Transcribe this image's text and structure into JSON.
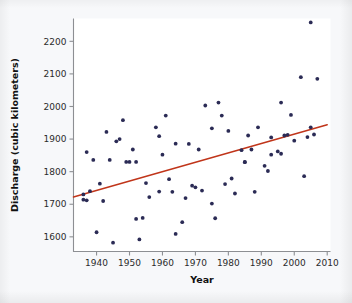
{
  "chart_data": {
    "type": "scatter",
    "title": "",
    "xlabel": "Year",
    "ylabel": "Discharge (cubic kilometers)",
    "xlim": [
      1933,
      2011
    ],
    "ylim": [
      1555,
      2270
    ],
    "grid": false,
    "legend": null,
    "x_ticks": [
      1940,
      1950,
      1960,
      1970,
      1980,
      1990,
      2000,
      2010
    ],
    "y_ticks": [
      1600,
      1700,
      1800,
      1900,
      2000,
      2100,
      2200
    ],
    "point_color": "#2b2b55",
    "trend_color": "#c0351a",
    "trend_line": {
      "name": "linear trend",
      "x_start": 1933,
      "y_start": 1722,
      "x_end": 2010,
      "y_end": 1944
    },
    "points": [
      {
        "x": 1936,
        "y": 1730
      },
      {
        "x": 1936,
        "y": 1714
      },
      {
        "x": 1937,
        "y": 1712
      },
      {
        "x": 1937,
        "y": 1860
      },
      {
        "x": 1938,
        "y": 1740
      },
      {
        "x": 1939,
        "y": 1836
      },
      {
        "x": 1940,
        "y": 1614
      },
      {
        "x": 1941,
        "y": 1763
      },
      {
        "x": 1942,
        "y": 1710
      },
      {
        "x": 1943,
        "y": 1922
      },
      {
        "x": 1944,
        "y": 1836
      },
      {
        "x": 1945,
        "y": 1582
      },
      {
        "x": 1946,
        "y": 1893
      },
      {
        "x": 1947,
        "y": 1900
      },
      {
        "x": 1948,
        "y": 1958
      },
      {
        "x": 1949,
        "y": 1830
      },
      {
        "x": 1950,
        "y": 1830
      },
      {
        "x": 1951,
        "y": 1868
      },
      {
        "x": 1952,
        "y": 1830
      },
      {
        "x": 1952,
        "y": 1655
      },
      {
        "x": 1953,
        "y": 1592
      },
      {
        "x": 1954,
        "y": 1658
      },
      {
        "x": 1955,
        "y": 1765
      },
      {
        "x": 1956,
        "y": 1722
      },
      {
        "x": 1958,
        "y": 1936
      },
      {
        "x": 1959,
        "y": 1909
      },
      {
        "x": 1959,
        "y": 1739
      },
      {
        "x": 1960,
        "y": 1852
      },
      {
        "x": 1961,
        "y": 1972
      },
      {
        "x": 1962,
        "y": 1777
      },
      {
        "x": 1963,
        "y": 1738
      },
      {
        "x": 1964,
        "y": 1886
      },
      {
        "x": 1964,
        "y": 1609
      },
      {
        "x": 1966,
        "y": 1645
      },
      {
        "x": 1967,
        "y": 1719
      },
      {
        "x": 1968,
        "y": 1885
      },
      {
        "x": 1969,
        "y": 1757
      },
      {
        "x": 1970,
        "y": 1752
      },
      {
        "x": 1971,
        "y": 1868
      },
      {
        "x": 1972,
        "y": 1742
      },
      {
        "x": 1973,
        "y": 2003
      },
      {
        "x": 1975,
        "y": 1933
      },
      {
        "x": 1975,
        "y": 1702
      },
      {
        "x": 1976,
        "y": 1657
      },
      {
        "x": 1977,
        "y": 2012
      },
      {
        "x": 1978,
        "y": 1972
      },
      {
        "x": 1979,
        "y": 1762
      },
      {
        "x": 1980,
        "y": 1925
      },
      {
        "x": 1981,
        "y": 1779
      },
      {
        "x": 1982,
        "y": 1733
      },
      {
        "x": 1984,
        "y": 1866
      },
      {
        "x": 1985,
        "y": 1830
      },
      {
        "x": 1985,
        "y": 1829
      },
      {
        "x": 1986,
        "y": 1911
      },
      {
        "x": 1987,
        "y": 1868
      },
      {
        "x": 1988,
        "y": 1738
      },
      {
        "x": 1989,
        "y": 1936
      },
      {
        "x": 1991,
        "y": 1818
      },
      {
        "x": 1992,
        "y": 1802
      },
      {
        "x": 1993,
        "y": 1852
      },
      {
        "x": 1993,
        "y": 1905
      },
      {
        "x": 1995,
        "y": 1862
      },
      {
        "x": 1996,
        "y": 1855
      },
      {
        "x": 1996,
        "y": 2012
      },
      {
        "x": 1997,
        "y": 1911
      },
      {
        "x": 1998,
        "y": 1913
      },
      {
        "x": 1999,
        "y": 1974
      },
      {
        "x": 2000,
        "y": 1895
      },
      {
        "x": 2002,
        "y": 2090
      },
      {
        "x": 2003,
        "y": 1786
      },
      {
        "x": 2004,
        "y": 1906
      },
      {
        "x": 2005,
        "y": 1936
      },
      {
        "x": 2005,
        "y": 2258
      },
      {
        "x": 2006,
        "y": 1914
      },
      {
        "x": 2007,
        "y": 2085
      }
    ]
  }
}
